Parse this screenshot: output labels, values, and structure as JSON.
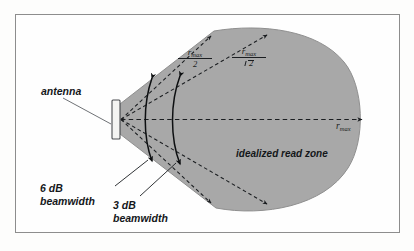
{
  "figure": {
    "kind": "rfid-antenna-read-zone-diagram",
    "colors": {
      "read_zone_fill": "#a8a8a8",
      "read_zone_stroke": "#8f8f8f",
      "frame_border": "#8d8d8d",
      "page_background": "#fdfdfc",
      "ink": "#14171a",
      "antenna_fill": "#f4f4f2",
      "leader_line": "#6f7276"
    },
    "labels": {
      "antenna": "antenna",
      "beamwidth_6db_line1": "6 dB",
      "beamwidth_6db_line2": "beamwidth",
      "beamwidth_3db_line1": "3 dB",
      "beamwidth_3db_line2": "beamwidth",
      "read_zone": "idealized read zone"
    },
    "math": {
      "r_max_over_2_numerator": "r",
      "r_max_over_2_subscript": "max",
      "r_max_over_2_denominator": "2",
      "r_max_over_sqrt2_numerator": "r",
      "r_max_over_sqrt2_subscript": "max",
      "r_max_over_sqrt2_denominator": "2",
      "r_max_axis": "r",
      "r_max_axis_subscript": "max"
    },
    "caption_fragment": ""
  }
}
